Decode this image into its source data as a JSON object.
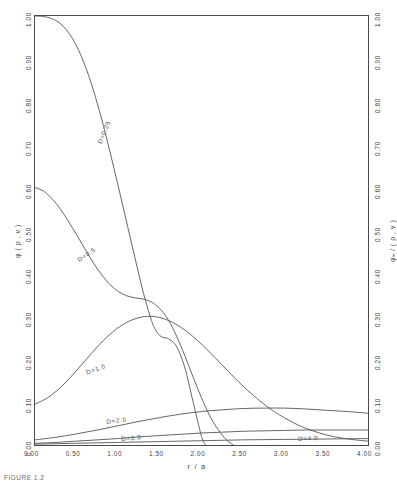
{
  "figure": {
    "caption": "FIGURE 1.2"
  },
  "chart_data": {
    "type": "line",
    "title": "",
    "xlabel": "r / a",
    "ylabel_left": "φ ( ρ , ν )",
    "ylabel_right": "φₕ / ( ρ , ν )",
    "xlim": [
      0.0,
      4.0
    ],
    "ylim": [
      0.0,
      1.0
    ],
    "grid": false,
    "legend": "inline-annotations",
    "xticks": [
      "0.00",
      "0.50",
      "1.00",
      "1.50",
      "2.00",
      "2.50",
      "3.00",
      "3.50",
      "4.00"
    ],
    "xtick_values": [
      0.0,
      0.5,
      1.0,
      1.5,
      2.0,
      2.5,
      3.0,
      3.5,
      4.0
    ],
    "yticks": [
      "0.00",
      "0.10",
      "0.20",
      "0.30",
      "0.40",
      "0.50",
      "0.60",
      "0.70",
      "0.80",
      "0.90",
      "1.00"
    ],
    "ytick_values": [
      0.0,
      0.1,
      0.2,
      0.3,
      0.4,
      0.5,
      0.6,
      0.7,
      0.8,
      0.9,
      1.0
    ],
    "yticks_right": [
      "0.00",
      "0.10",
      "0.20",
      "0.30",
      "0.40",
      "0.50",
      "0.60",
      "0.70",
      "0.80",
      "0.90",
      "1.00"
    ],
    "minor_ticks_per_interval": 2,
    "series": [
      {
        "name": "D=0.25",
        "label": "D=0.25",
        "label_rotation": -68,
        "x": [
          0.0,
          0.1,
          0.2,
          0.3,
          0.4,
          0.5,
          0.6,
          0.7,
          0.8,
          0.9,
          1.0,
          1.1,
          1.2,
          1.3,
          1.4,
          1.45,
          1.5,
          1.55,
          1.6,
          1.7,
          1.8,
          1.9,
          2.0,
          2.05
        ],
        "y": [
          1.0,
          0.999,
          0.994,
          0.983,
          0.962,
          0.93,
          0.885,
          0.828,
          0.76,
          0.684,
          0.603,
          0.52,
          0.437,
          0.356,
          0.29,
          0.268,
          0.255,
          0.25,
          0.248,
          0.23,
          0.18,
          0.1,
          0.02,
          0.0
        ]
      },
      {
        "name": "D=0.5",
        "label": "D=0.5",
        "label_rotation": -34,
        "x": [
          0.0,
          0.1,
          0.2,
          0.3,
          0.4,
          0.5,
          0.6,
          0.7,
          0.8,
          0.9,
          1.0,
          1.1,
          1.2,
          1.3,
          1.4,
          1.5,
          1.6,
          1.7,
          1.8,
          1.9,
          2.0,
          2.1,
          2.2,
          2.3,
          2.38
        ],
        "y": [
          0.6,
          0.592,
          0.575,
          0.551,
          0.522,
          0.49,
          0.457,
          0.425,
          0.397,
          0.374,
          0.358,
          0.348,
          0.343,
          0.34,
          0.333,
          0.318,
          0.292,
          0.254,
          0.208,
          0.158,
          0.11,
          0.068,
          0.036,
          0.012,
          0.0
        ]
      },
      {
        "name": "D=1.0",
        "label": "D=1.0",
        "label_rotation": -20,
        "x": [
          0.0,
          0.15,
          0.3,
          0.45,
          0.6,
          0.75,
          0.9,
          1.05,
          1.2,
          1.35,
          1.5,
          1.65,
          1.8,
          1.95,
          2.1,
          2.25,
          2.4,
          2.55,
          2.7,
          2.85,
          3.0,
          3.2,
          3.4,
          3.6,
          3.8,
          4.0
        ],
        "y": [
          0.095,
          0.11,
          0.133,
          0.163,
          0.196,
          0.229,
          0.258,
          0.28,
          0.294,
          0.3,
          0.297,
          0.286,
          0.268,
          0.244,
          0.216,
          0.186,
          0.156,
          0.128,
          0.103,
          0.081,
          0.063,
          0.043,
          0.029,
          0.019,
          0.013,
          0.009
        ]
      },
      {
        "name": "D=2.0",
        "label": "D=2.0",
        "label_rotation": -7,
        "x": [
          0.0,
          0.25,
          0.5,
          0.75,
          1.0,
          1.25,
          1.5,
          1.75,
          2.0,
          2.25,
          2.5,
          2.75,
          3.0,
          3.25,
          3.5,
          3.75,
          4.0
        ],
        "y": [
          0.012,
          0.018,
          0.026,
          0.035,
          0.045,
          0.055,
          0.064,
          0.072,
          0.078,
          0.082,
          0.085,
          0.086,
          0.086,
          0.084,
          0.081,
          0.078,
          0.074
        ]
      },
      {
        "name": "D=3.0",
        "label": "D=3.0",
        "label_rotation": -5,
        "x": [
          0.0,
          0.25,
          0.5,
          0.75,
          1.0,
          1.25,
          1.5,
          1.75,
          2.0,
          2.25,
          2.5,
          2.75,
          3.0,
          3.25,
          3.5,
          3.75,
          4.0
        ],
        "y": [
          0.004,
          0.006,
          0.009,
          0.012,
          0.015,
          0.019,
          0.022,
          0.025,
          0.028,
          0.03,
          0.032,
          0.033,
          0.034,
          0.035,
          0.035,
          0.035,
          0.035
        ]
      },
      {
        "name": "D=4.0",
        "label": "D=4.0",
        "label_rotation": -3,
        "x": [
          0.0,
          0.5,
          1.0,
          1.5,
          2.0,
          2.5,
          3.0,
          3.5,
          4.0
        ],
        "y": [
          0.002,
          0.004,
          0.006,
          0.008,
          0.01,
          0.012,
          0.013,
          0.014,
          0.015
        ]
      }
    ]
  }
}
